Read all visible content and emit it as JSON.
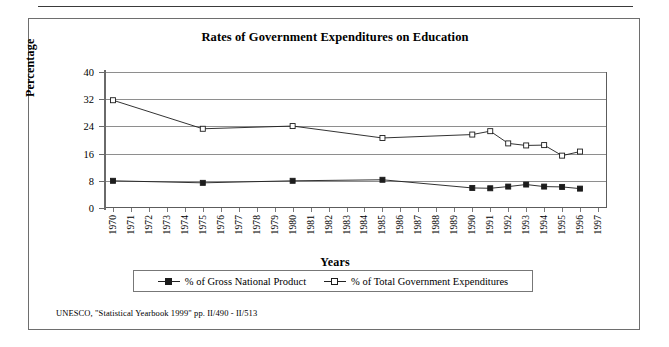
{
  "figure": {
    "title": "Rates of Government Expenditures on Education",
    "source_note": "UNESCO, \"Statistical Yearbook 1999\" pp. II/490 - II/513"
  },
  "axes": {
    "y_title": "Percentage",
    "x_title": "Years"
  },
  "legend": {
    "entries": [
      {
        "label": "% of Gross National Product",
        "marker": "filled-square-marker",
        "color": "#1c1c1c"
      },
      {
        "label": "% of Total Government Expenditures",
        "marker": "open-square-marker",
        "color": "#1c1c1c"
      }
    ]
  },
  "chart_data": {
    "type": "line",
    "title": "Rates of Government Expenditures on Education",
    "xlabel": "Years",
    "ylabel": "Percentage",
    "ylim": [
      0,
      40
    ],
    "yticks": [
      0,
      8,
      16,
      24,
      32,
      40
    ],
    "grid": true,
    "legend_position": "bottom",
    "categories": [
      "1970",
      "1971",
      "1972",
      "1973",
      "1974",
      "1975",
      "1976",
      "1977",
      "1978",
      "1979",
      "1980",
      "1981",
      "1982",
      "1983",
      "1984",
      "1985",
      "1986",
      "1987",
      "1988",
      "1989",
      "1990",
      "1991",
      "1992",
      "1993",
      "1994",
      "1995",
      "1996",
      "1997"
    ],
    "series": [
      {
        "name": "% of Gross National Product",
        "marker": "filled-square",
        "color": "#1c1c1c",
        "points": [
          {
            "x": "1970",
            "y": 8.0
          },
          {
            "x": "1975",
            "y": 7.4
          },
          {
            "x": "1980",
            "y": 8.0
          },
          {
            "x": "1985",
            "y": 8.3
          },
          {
            "x": "1990",
            "y": 5.9
          },
          {
            "x": "1991",
            "y": 5.8
          },
          {
            "x": "1992",
            "y": 6.3
          },
          {
            "x": "1993",
            "y": 6.9
          },
          {
            "x": "1994",
            "y": 6.3
          },
          {
            "x": "1995",
            "y": 6.2
          },
          {
            "x": "1996",
            "y": 5.7
          }
        ]
      },
      {
        "name": "% of Total Government Expenditures",
        "marker": "open-square",
        "color": "#1c1c1c",
        "points": [
          {
            "x": "1970",
            "y": 31.7
          },
          {
            "x": "1975",
            "y": 23.3
          },
          {
            "x": "1980",
            "y": 24.1
          },
          {
            "x": "1985",
            "y": 20.6
          },
          {
            "x": "1990",
            "y": 21.6
          },
          {
            "x": "1991",
            "y": 22.6
          },
          {
            "x": "1992",
            "y": 19.0
          },
          {
            "x": "1993",
            "y": 18.4
          },
          {
            "x": "1994",
            "y": 18.5
          },
          {
            "x": "1995",
            "y": 15.4
          },
          {
            "x": "1996",
            "y": 16.6
          }
        ]
      }
    ]
  }
}
